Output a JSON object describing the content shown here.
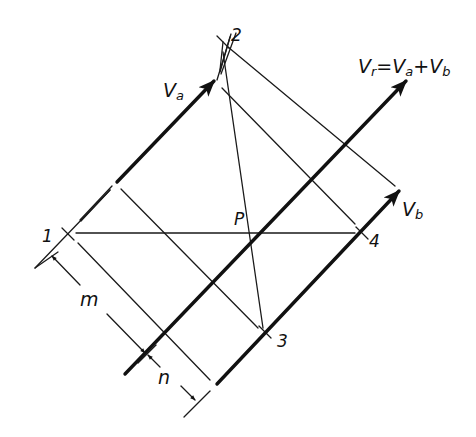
{
  "diagram": {
    "points": {
      "p1": "1",
      "p2": "2",
      "p3": "3",
      "p4": "4",
      "center": "P"
    },
    "vectors": {
      "va": {
        "main": "V",
        "sub": "a"
      },
      "vb": {
        "main": "V",
        "sub": "b"
      },
      "vr_equation": {
        "lhs_main": "V",
        "lhs_sub": "r",
        "eq": "=",
        "t1_main": "V",
        "t1_sub": "a",
        "plus": "+",
        "t2_main": "V",
        "t2_sub": "b"
      }
    },
    "dimensions": {
      "m": "m",
      "n": "n"
    },
    "colors": {
      "ink": "#111111",
      "background": "#ffffff"
    }
  }
}
